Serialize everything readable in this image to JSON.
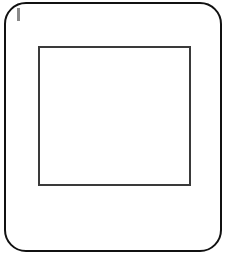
{
  "icon": {
    "name": "slide-frame-icon",
    "description": "Rounded-square frame containing an inner rectangle with a small vertical mark at the top-left",
    "colors": {
      "outer_stroke": "#111111",
      "inner_stroke": "#3a3a3a",
      "mark": "#8a8a8a",
      "background": "#ffffff"
    }
  }
}
